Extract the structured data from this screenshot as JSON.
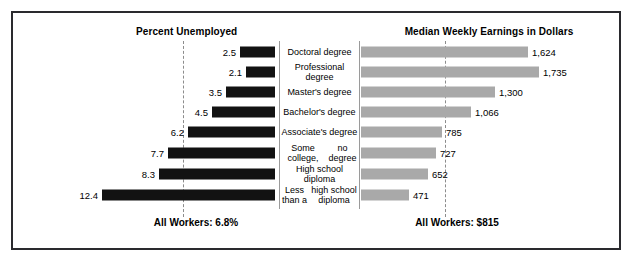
{
  "figure": {
    "left_title": "Percent Unemployed",
    "right_title": "Median Weekly Earnings in Dollars",
    "left_footer": "All Workers: 6.8%",
    "right_footer": "All Workers: $815",
    "bar_color_left": "#121212",
    "bar_color_right": "#a9a9a9",
    "border_color": "#2a2a2e",
    "reference_line_color": "#8c8c8c"
  },
  "chart_data": {
    "type": "bar",
    "orientation": "horizontal",
    "layout": "diverging-paired-panels",
    "categories": [
      "Doctoral degree",
      "Professional degree",
      "Master's degree",
      "Bachelor's degree",
      "Associate's degree",
      "Some college,\nno degree",
      "High school diploma",
      "Less than a\nhigh school diploma"
    ],
    "category_lines": [
      [
        "Doctoral degree"
      ],
      [
        "Professional degree"
      ],
      [
        "Master's degree"
      ],
      [
        "Bachelor's degree"
      ],
      [
        "Associate's degree"
      ],
      [
        "Some college,",
        "no degree"
      ],
      [
        "High school diploma"
      ],
      [
        "Less than a",
        "high school diploma"
      ]
    ],
    "series": [
      {
        "name": "Percent Unemployed",
        "panel": "left",
        "unit": "percent",
        "direction": "right-to-left",
        "values": [
          2.5,
          2.1,
          3.5,
          4.5,
          6.2,
          7.7,
          8.3,
          12.4
        ],
        "labels": [
          "2.5",
          "2.1",
          "3.5",
          "4.5",
          "6.2",
          "7.7",
          "8.3",
          "12.4"
        ],
        "reference_line": {
          "label": "All Workers: 6.8%",
          "value": 6.8
        },
        "xlim": [
          0,
          12.4
        ],
        "color": "#121212"
      },
      {
        "name": "Median Weekly Earnings in Dollars",
        "panel": "right",
        "unit": "dollars",
        "direction": "left-to-right",
        "values": [
          1624,
          1735,
          1300,
          1066,
          785,
          727,
          652,
          471
        ],
        "labels": [
          "1,624",
          "1,735",
          "1,300",
          "1,066",
          "785",
          "727",
          "652",
          "471"
        ],
        "reference_line": {
          "label": "All Workers: $815",
          "value": 815
        },
        "xlim": [
          0,
          1735
        ],
        "color": "#a9a9a9"
      }
    ],
    "xlabel": "",
    "ylabel": "",
    "grid": false,
    "legend": "none"
  }
}
